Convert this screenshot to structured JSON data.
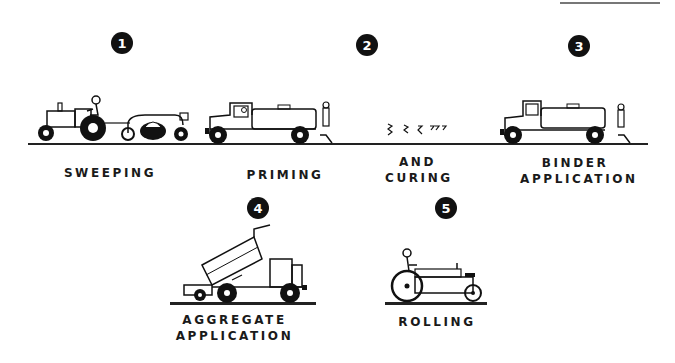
{
  "diagram": {
    "type": "process-sequence",
    "steps": [
      {
        "number": "1",
        "label_lines": [
          "SWEEPING"
        ],
        "equipment": "tractor-towed rotary broom"
      },
      {
        "number": "2",
        "label_lines": [
          "PRIMING"
        ],
        "equipment": "bituminous distributor truck"
      },
      {
        "number": "2b",
        "label_lines": [
          "AND",
          "CURING"
        ],
        "equipment": "vapor wisps"
      },
      {
        "number": "3",
        "label_lines": [
          "BINDER",
          "APPLICATION"
        ],
        "equipment": "bituminous distributor truck"
      },
      {
        "number": "4",
        "label_lines": [
          "AGGREGATE",
          "APPLICATION"
        ],
        "equipment": "dump truck with aggregate spreader"
      },
      {
        "number": "5",
        "label_lines": [
          "ROLLING"
        ],
        "equipment": "roller"
      }
    ]
  },
  "badges": {
    "b1": "1",
    "b2": "2",
    "b3": "3",
    "b4": "4",
    "b5": "5"
  },
  "labels": {
    "sweeping": "SWEEPING",
    "priming": "PRIMING",
    "and": "AND",
    "curing": "CURING",
    "binder": "BINDER",
    "application3": "APPLICATION",
    "aggregate": "AGGREGATE",
    "application4": "APPLICATION",
    "rolling": "ROLLING"
  },
  "colors": {
    "ink": "#111111",
    "background": "#ffffff"
  }
}
